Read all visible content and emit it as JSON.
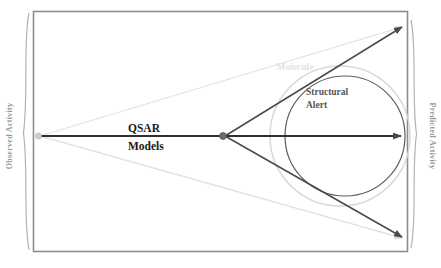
{
  "diagram": {
    "axes": {
      "left_label": "Observed Activity",
      "right_label": "Predicted Activity"
    },
    "labels": {
      "center_line1": "QSAR",
      "center_line2": "Models",
      "alert_line1": "Structural",
      "alert_line2": "Alert",
      "molecule": "Molecule"
    },
    "colors": {
      "frame": "#8c8c8c",
      "brace": "#aaaaaa",
      "arrow_dark": "#4a4a4a",
      "arrow_light": "#e0e0e0",
      "circle_outer": "#d8d8d8",
      "circle_inner": "#5e5e5e",
      "node": "#7a7a7a",
      "text_dark": "#1a1a1a",
      "text_mid": "#575757",
      "text_faint": "#e2e2e2",
      "axis_text": "#9a9a9a"
    },
    "geometry": {
      "frame": {
        "x": 33,
        "y": 11,
        "width": 375,
        "height": 241
      },
      "left_vertex": {
        "x": 38,
        "y": 136
      },
      "mid_vertex": {
        "x": 223,
        "y": 136
      },
      "top_right": {
        "x": 406,
        "y": 25
      },
      "bottom_right": {
        "x": 406,
        "y": 240
      },
      "right_tip": {
        "x": 406,
        "y": 136
      },
      "circle_outer": {
        "cx": 340,
        "cy": 136,
        "r": 70
      },
      "circle_inner": {
        "cx": 345,
        "cy": 136,
        "r": 60
      }
    }
  }
}
